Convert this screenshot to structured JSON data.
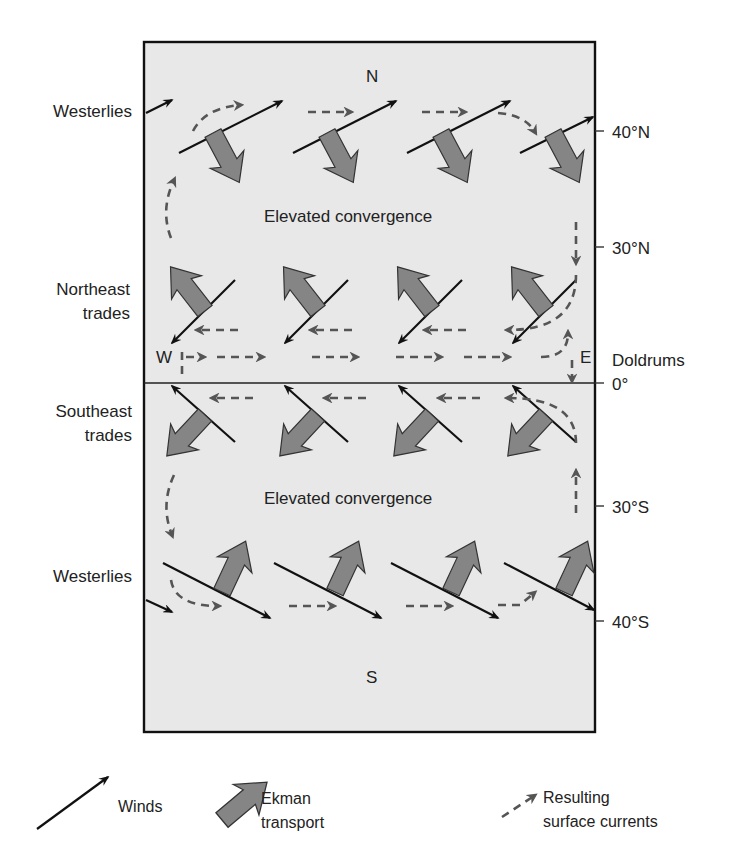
{
  "diagram": {
    "title_hidden": "Wind-driven Ekman transport and surface currents",
    "compass": {
      "north": "N",
      "south": "S",
      "west": "W",
      "east": "E"
    },
    "left_labels": [
      {
        "id": "westerlies-n",
        "lines": [
          "Westerlies"
        ]
      },
      {
        "id": "ne-trades",
        "lines": [
          "Northeast",
          "trades"
        ]
      },
      {
        "id": "se-trades",
        "lines": [
          "Southeast",
          "trades"
        ]
      },
      {
        "id": "westerlies-s",
        "lines": [
          "Westerlies"
        ]
      }
    ],
    "right_labels": {
      "lat_40n": "40°N",
      "lat_30n": "30°N",
      "doldrums": "Doldrums",
      "lat_0": "0°",
      "lat_30s": "30°S",
      "lat_40s": "40°S"
    },
    "zones": {
      "north_convergence": "Elevated convergence",
      "south_convergence": "Elevated convergence"
    },
    "colors": {
      "ocean_box": "#e8e8e8",
      "ekman_arrow": "#858585",
      "wind_line": "#111111",
      "current": "#555555"
    }
  },
  "legend": {
    "winds": "Winds",
    "ekman_line1": "Ekman",
    "ekman_line2": "transport",
    "currents_line1": "Resulting",
    "currents_line2": "surface currents"
  }
}
